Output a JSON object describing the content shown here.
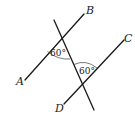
{
  "diagram": {
    "type": "parallel-lines-with-transversal",
    "points": {
      "A": "A",
      "B": "B",
      "C": "C",
      "D": "D"
    },
    "angles": [
      {
        "label": "60°",
        "position": "between ray to A and transversal (lower) at first intersection"
      },
      {
        "label": "60°",
        "position": "between transversal (upper) and ray to C at second intersection"
      }
    ],
    "colors": {
      "line": "#1a1a1a",
      "arc": "#555555",
      "background": "#ffffff"
    }
  }
}
